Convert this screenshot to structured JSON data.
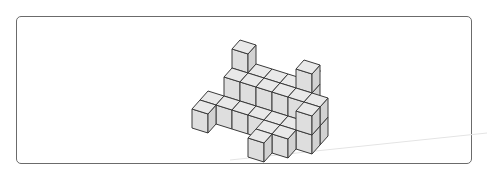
{
  "figure": {
    "frame": {
      "left": 16,
      "top": 16,
      "width": 456,
      "height": 148,
      "radius": 5,
      "stroke": "#6b6b6b"
    },
    "colors": {
      "top": "#e9e9e9",
      "front": "#dedede",
      "right": "#d2d2d2",
      "edge": "#3a3a3a"
    },
    "projection": {
      "origin": [
        184,
        137
      ],
      "x_axis": [
        16,
        5
      ],
      "depth_axis": [
        8,
        -9
      ],
      "z_axis": [
        0,
        -19
      ]
    },
    "columns": [
      {
        "x": 1,
        "d": 4,
        "h": 3
      },
      {
        "x": 2,
        "d": 4,
        "h": 2
      },
      {
        "x": 3,
        "d": 4,
        "h": 2
      },
      {
        "x": 4,
        "d": 4,
        "h": 2
      },
      {
        "x": 5,
        "d": 4,
        "h": 3
      },
      {
        "x": 1,
        "d": 3,
        "h": 2
      },
      {
        "x": 2,
        "d": 3,
        "h": 2
      },
      {
        "x": 3,
        "d": 3,
        "h": 2
      },
      {
        "x": 4,
        "d": 3,
        "h": 2
      },
      {
        "x": 5,
        "d": 3,
        "h": 2
      },
      {
        "x": 6,
        "d": 3,
        "h": 2
      },
      {
        "x": 0,
        "d": 2,
        "h": 1
      },
      {
        "x": 1,
        "d": 2,
        "h": 1
      },
      {
        "x": 2,
        "d": 2,
        "h": 1
      },
      {
        "x": 3,
        "d": 2,
        "h": 1
      },
      {
        "x": 4,
        "d": 2,
        "h": 1
      },
      {
        "x": 5,
        "d": 2,
        "h": 1
      },
      {
        "x": 6,
        "d": 2,
        "h": 2
      },
      {
        "x": 0,
        "d": 1,
        "h": 1,
        "z0": 0
      },
      {
        "x": 4,
        "d": 1,
        "h": 1
      },
      {
        "x": 5,
        "d": 1,
        "h": 1
      },
      {
        "x": 4,
        "d": 0,
        "h": 1
      }
    ],
    "stray_dot": [
      319,
      70
    ],
    "stray_line": {
      "from": [
        230,
        160
      ],
      "to": [
        487,
        133
      ],
      "color": "#e4e4e4"
    }
  }
}
